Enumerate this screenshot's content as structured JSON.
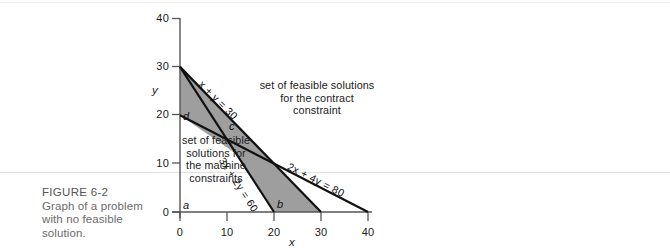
{
  "caption": {
    "title": "FIGURE 6-2",
    "line1": "Graph of a problem",
    "line2": "with no feasible",
    "line3": "solution."
  },
  "annotations": {
    "contract": "set of feasible solutions for the contract constraint",
    "machine": "set of feasible solutions for the machine constraints"
  },
  "chart_data": {
    "type": "line",
    "title": "Graph of a problem with no feasible solution.",
    "xlabel": "x",
    "ylabel": "y",
    "xlim": [
      0,
      40
    ],
    "ylim": [
      0,
      40
    ],
    "xticks": [
      0,
      10,
      20,
      30,
      40
    ],
    "yticks": [
      0,
      10,
      20,
      30,
      40
    ],
    "grid": false,
    "legend": "none",
    "series": [
      {
        "name": "x + y = 30",
        "label": "x + y = 30",
        "points": [
          [
            0,
            30
          ],
          [
            30,
            0
          ]
        ],
        "x_intercept": 30,
        "y_intercept": 30
      },
      {
        "name": "3x + 2y = 60",
        "label": "3x + 2y = 60",
        "points": [
          [
            0,
            30
          ],
          [
            20,
            0
          ]
        ],
        "x_intercept": 20,
        "y_intercept": 30
      },
      {
        "name": "2x + 4y = 80",
        "label": "2x + 4y = 80",
        "points": [
          [
            0,
            20
          ],
          [
            40,
            0
          ]
        ],
        "x_intercept": 40,
        "y_intercept": 20
      }
    ],
    "vertices": [
      {
        "name": "a",
        "x": 0,
        "y": 0
      },
      {
        "name": "b",
        "x": 20,
        "y": 0
      },
      {
        "name": "c",
        "x": 10,
        "y": 15
      },
      {
        "name": "d",
        "x": 0,
        "y": 20
      }
    ],
    "shaded_regions": [
      {
        "name": "machine-constraint-region",
        "fill": "#9e9e9e",
        "polygon": [
          [
            0,
            30
          ],
          [
            30,
            0
          ],
          [
            20,
            0
          ]
        ]
      },
      {
        "name": "contract-constraint-region",
        "fill": "#9e9e9e",
        "polygon": [
          [
            0,
            20
          ],
          [
            0,
            30
          ],
          [
            30,
            0
          ]
        ]
      }
    ],
    "annotations": [
      {
        "name": "contract-note",
        "text": "set of feasible solutions for the contract constraint"
      },
      {
        "name": "machine-note",
        "text": "set of feasible solutions for the machine constraints"
      }
    ]
  },
  "colors": {
    "shade": "#9e9e9e",
    "line": "#111111",
    "axis": "#555555",
    "caption": "#6a6a6a",
    "rule": "#e2e2e2"
  },
  "axis": {
    "x_label": "x",
    "y_label": "y",
    "x_ticks": [
      "0",
      "10",
      "20",
      "30",
      "40"
    ],
    "y_ticks": [
      "0",
      "10",
      "20",
      "30",
      "40"
    ]
  },
  "line_labels": {
    "contract": "x + y = 30",
    "machine_a": "3x + 2y = 60",
    "machine_b": "2x + 4y = 80"
  },
  "vertex_labels": {
    "a": "a",
    "b": "b",
    "c": "c",
    "d": "d"
  }
}
